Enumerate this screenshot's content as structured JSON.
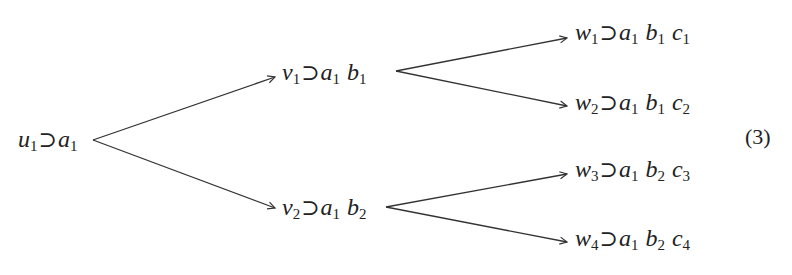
{
  "diagram": {
    "type": "tree",
    "direction": "left-to-right",
    "stroke_color": "#333333",
    "equation_number": "(3)",
    "nodes": [
      {
        "id": "u1",
        "terms": [
          {
            "v": "u",
            "s": "1"
          },
          {
            "op": "⊃"
          },
          {
            "v": "a",
            "s": "1"
          }
        ]
      },
      {
        "id": "v1",
        "terms": [
          {
            "v": "v",
            "s": "1"
          },
          {
            "op": "⊃"
          },
          {
            "v": "a",
            "s": "1"
          },
          {
            "v": "b",
            "s": "1"
          }
        ]
      },
      {
        "id": "v2",
        "terms": [
          {
            "v": "v",
            "s": "2"
          },
          {
            "op": "⊃"
          },
          {
            "v": "a",
            "s": "1"
          },
          {
            "v": "b",
            "s": "2"
          }
        ]
      },
      {
        "id": "w1",
        "terms": [
          {
            "v": "w",
            "s": "1"
          },
          {
            "op": "⊃"
          },
          {
            "v": "a",
            "s": "1"
          },
          {
            "v": "b",
            "s": "1"
          },
          {
            "v": "c",
            "s": "1"
          }
        ]
      },
      {
        "id": "w2",
        "terms": [
          {
            "v": "w",
            "s": "2"
          },
          {
            "op": "⊃"
          },
          {
            "v": "a",
            "s": "1"
          },
          {
            "v": "b",
            "s": "1"
          },
          {
            "v": "c",
            "s": "2"
          }
        ]
      },
      {
        "id": "w3",
        "terms": [
          {
            "v": "w",
            "s": "3"
          },
          {
            "op": "⊃"
          },
          {
            "v": "a",
            "s": "1"
          },
          {
            "v": "b",
            "s": "2"
          },
          {
            "v": "c",
            "s": "3"
          }
        ]
      },
      {
        "id": "w4",
        "terms": [
          {
            "v": "w",
            "s": "4"
          },
          {
            "op": "⊃"
          },
          {
            "v": "a",
            "s": "1"
          },
          {
            "v": "b",
            "s": "2"
          },
          {
            "v": "c",
            "s": "4"
          }
        ]
      }
    ],
    "labels": {
      "u1": "u₁ ⊃ a₁",
      "v1": "v₁ ⊃ a₁ b₁",
      "v2": "v₂ ⊃ a₁ b₂",
      "w1": "w₁ ⊃ a₁ b₁ c₁",
      "w2": "w₂ ⊃ a₁ b₁ c₂",
      "w3": "w₃ ⊃ a₁ b₂ c₃",
      "w4": "w₄ ⊃ a₁ b₂ c₄"
    },
    "edges": [
      {
        "from": "u1",
        "to": "v1"
      },
      {
        "from": "u1",
        "to": "v2"
      },
      {
        "from": "v1",
        "to": "w1"
      },
      {
        "from": "v1",
        "to": "w2"
      },
      {
        "from": "v2",
        "to": "w3"
      },
      {
        "from": "v2",
        "to": "w4"
      }
    ]
  }
}
